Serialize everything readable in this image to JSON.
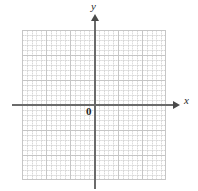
{
  "figure": {
    "type": "blank-cartesian-grid",
    "background_color": "#ffffff"
  },
  "axes": {
    "x_label": "x",
    "y_label": "y",
    "origin_label": "0",
    "axis_color": "#6b6b6b",
    "arrow_color": "#4a4a4a",
    "x_arrow_icon": "arrow-right-icon",
    "y_arrow_icon": "arrow-up-icon"
  },
  "grid": {
    "major_color": "#c6c6c6",
    "minor_color": "#d8d8d8",
    "major_columns": 6,
    "major_rows": 6,
    "minor_per_major": 5
  },
  "chart_data": {
    "type": "scatter",
    "title": "",
    "subtitle": "",
    "xlabel": "x",
    "ylabel": "y",
    "series": [
      {
        "name": "",
        "x": [],
        "y": []
      }
    ],
    "x": [],
    "values": [],
    "categories": [],
    "xlim": [
      -3,
      3
    ],
    "ylim": [
      -3,
      3
    ],
    "xticks": [
      -3,
      -2,
      -1,
      0,
      1,
      2,
      3
    ],
    "yticks": [
      -3,
      -2,
      -1,
      0,
      1,
      2,
      3
    ],
    "xticklabels": [
      "",
      "",
      "",
      "0",
      "",
      "",
      ""
    ],
    "yticklabels": [
      "",
      "",
      "",
      "",
      "",
      "",
      ""
    ],
    "grid": true,
    "minor_grid": true,
    "legend": [],
    "legend_position": "none",
    "annotations": [
      {
        "text": "0",
        "x": 0,
        "y": 0,
        "role": "origin-label"
      },
      {
        "text": "x",
        "role": "x-axis-label"
      },
      {
        "text": "y",
        "role": "y-axis-label"
      }
    ],
    "note": "Empty coordinate plane with no plotted data points or curves."
  }
}
